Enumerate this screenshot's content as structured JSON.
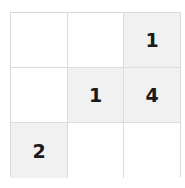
{
  "puzzle": {
    "rows": 3,
    "cols": 3,
    "cells": [
      [
        {
          "value": "",
          "shaded": false
        },
        {
          "value": "",
          "shaded": false
        },
        {
          "value": "1",
          "shaded": true
        }
      ],
      [
        {
          "value": "",
          "shaded": false
        },
        {
          "value": "1",
          "shaded": true
        },
        {
          "value": "4",
          "shaded": true
        }
      ],
      [
        {
          "value": "2",
          "shaded": true
        },
        {
          "value": "",
          "shaded": false
        },
        {
          "value": "",
          "shaded": false
        }
      ]
    ]
  },
  "colors": {
    "shaded": "#f1f1f1",
    "empty": "#ffffff",
    "grid_line": "#dcdcdc",
    "digit": "#1a1a1a"
  }
}
